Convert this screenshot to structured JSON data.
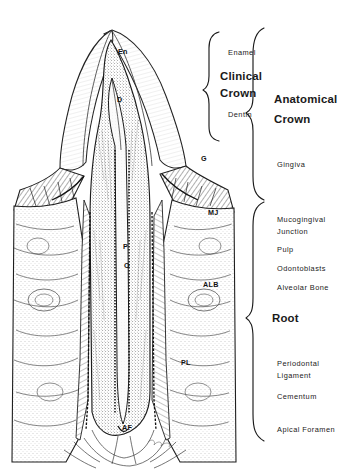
{
  "figure": {
    "background_color": "#ffffff",
    "ink_color": "#1a1a1a"
  },
  "brace_groups": [
    {
      "id": "clinical-crown",
      "label": "Clinical Crown",
      "emphasis": "major",
      "members": [
        "Enamel",
        "Dentin"
      ]
    },
    {
      "id": "anatomical-crown",
      "label": "Anatomical Crown",
      "emphasis": "major",
      "members": [
        "Enamel",
        "Dentin",
        "Gingiva"
      ]
    },
    {
      "id": "root",
      "label": "Root",
      "emphasis": "major",
      "members": [
        "Periodontal Ligament",
        "Cementum",
        "Apical Foramen"
      ]
    }
  ],
  "right_labels": [
    {
      "id": "enamel",
      "text": "Enamel",
      "x": 228,
      "y": 55,
      "style": "plain"
    },
    {
      "id": "clinical-crown",
      "text": "Clinical",
      "x": 220,
      "y": 80,
      "style": "major"
    },
    {
      "id": "clinical-crown-2",
      "text": "Crown",
      "x": 220,
      "y": 97,
      "style": "major"
    },
    {
      "id": "dentin",
      "text": "Dentin",
      "x": 228,
      "y": 117,
      "style": "plain"
    },
    {
      "id": "anatomical-crown",
      "text": "Anatomical",
      "x": 274,
      "y": 103,
      "style": "major"
    },
    {
      "id": "anatomical-crown-2",
      "text": "Crown",
      "x": 274,
      "y": 123,
      "style": "major"
    },
    {
      "id": "gingiva",
      "text": "Gingiva",
      "x": 277,
      "y": 167,
      "style": "plain"
    },
    {
      "id": "mucogingival-junction",
      "text": "Mucogingival",
      "x": 277,
      "y": 222,
      "style": "plain"
    },
    {
      "id": "mucogingival-junction-2",
      "text": "Junction",
      "x": 277,
      "y": 234,
      "style": "plain"
    },
    {
      "id": "pulp",
      "text": "Pulp",
      "x": 277,
      "y": 252,
      "style": "plain"
    },
    {
      "id": "odontoblasts",
      "text": "Odontoblasts",
      "x": 277,
      "y": 271,
      "style": "plain"
    },
    {
      "id": "alveolar-bone",
      "text": "Alveolar Bone",
      "x": 277,
      "y": 290,
      "style": "plain"
    },
    {
      "id": "root",
      "text": "Root",
      "x": 272,
      "y": 322,
      "style": "major"
    },
    {
      "id": "periodontal-ligament",
      "text": "Periodontal",
      "x": 277,
      "y": 366,
      "style": "plain"
    },
    {
      "id": "periodontal-ligament-2",
      "text": "Ligament",
      "x": 277,
      "y": 378,
      "style": "plain"
    },
    {
      "id": "cementum",
      "text": "Cementum",
      "x": 277,
      "y": 399,
      "style": "plain"
    },
    {
      "id": "apical-foramen",
      "text": "Apical  Foramen",
      "x": 277,
      "y": 432,
      "style": "plain"
    }
  ],
  "inner_labels": [
    {
      "id": "en",
      "text": "En",
      "x": 118,
      "y": 54,
      "meaning": "Enamel"
    },
    {
      "id": "d",
      "text": "D",
      "x": 117,
      "y": 102,
      "meaning": "Dentin"
    },
    {
      "id": "g",
      "text": "G",
      "x": 201,
      "y": 161,
      "meaning": "Gingiva"
    },
    {
      "id": "mj",
      "text": "MJ",
      "x": 208,
      "y": 215,
      "meaning": "Mucogingival Junction"
    },
    {
      "id": "p",
      "text": "P",
      "x": 123,
      "y": 249,
      "meaning": "Pulp"
    },
    {
      "id": "o",
      "text": "O",
      "x": 124,
      "y": 268,
      "meaning": "Odontoblasts"
    },
    {
      "id": "alb",
      "text": "ALB",
      "x": 203,
      "y": 287,
      "meaning": "Alveolar Bone"
    },
    {
      "id": "pl",
      "text": "PL",
      "x": 181,
      "y": 365,
      "meaning": "Periodontal Ligament"
    },
    {
      "id": "af",
      "text": "AF",
      "x": 122,
      "y": 430,
      "meaning": "Apical Foramen"
    }
  ]
}
